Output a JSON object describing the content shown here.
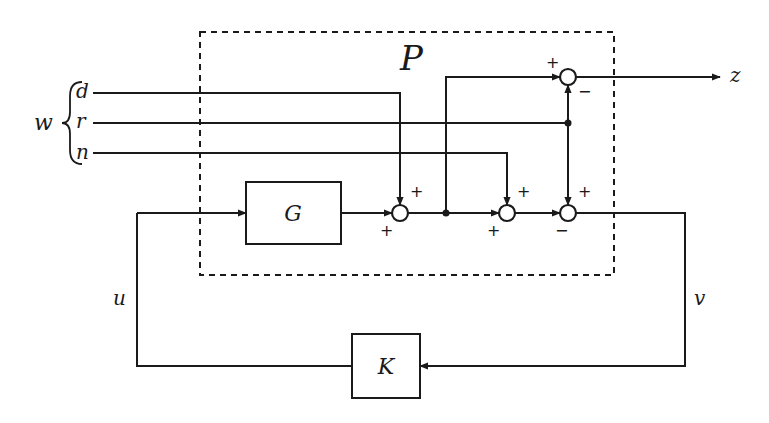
{
  "diagram": {
    "plant_box": {
      "label": "P"
    },
    "blocks": {
      "G": {
        "label": "G"
      },
      "K": {
        "label": "K"
      }
    },
    "signals": {
      "w": "w",
      "d": "d",
      "r": "r",
      "n": "n",
      "z": "z",
      "u": "u",
      "v": "v"
    },
    "summing_junctions": [
      {
        "id": "s1",
        "inputs": [
          {
            "from": "G",
            "sign": "+"
          },
          {
            "from": "d",
            "sign": "+"
          }
        ]
      },
      {
        "id": "s2",
        "inputs": [
          {
            "from": "s1",
            "sign": "+"
          },
          {
            "from": "n",
            "sign": "+"
          }
        ]
      },
      {
        "id": "s3",
        "inputs": [
          {
            "from": "s2",
            "sign": "−"
          },
          {
            "from": "r",
            "sign": "+"
          }
        ]
      },
      {
        "id": "s4",
        "inputs": [
          {
            "from": "s1",
            "sign": "+"
          },
          {
            "from": "r",
            "sign": "−"
          }
        ]
      }
    ],
    "signs": {
      "s1_top": "+",
      "s1_bottom": "+",
      "s2_top": "+",
      "s2_bottom": "+",
      "s3_top": "+",
      "s3_bottom": "−",
      "s4_top": "+",
      "s4_right": "−"
    },
    "colors": {
      "ink": "#1a1a1a",
      "background": "#ffffff"
    }
  }
}
